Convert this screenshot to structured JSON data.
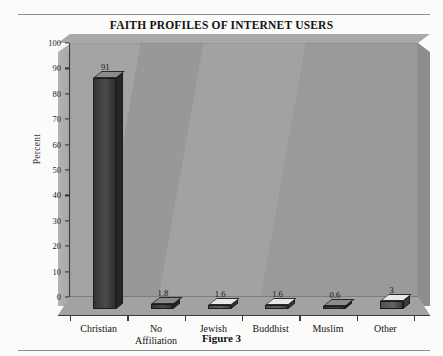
{
  "figure": {
    "caption": "Figure 3"
  },
  "chart_data": {
    "type": "bar",
    "title": "FAITH PROFILES OF INTERNET USERS",
    "xlabel": "",
    "ylabel": "Percent",
    "ylim": [
      0,
      100
    ],
    "ytick_step": 10,
    "grid": false,
    "legend": "none",
    "categories": [
      "Christian",
      "No\nAffiliation",
      "Jewish",
      "Buddhist",
      "Muslim",
      "Other"
    ],
    "values": [
      91,
      1.8,
      1.6,
      1.6,
      0.6,
      3
    ],
    "value_labels": [
      "91",
      "1.8",
      "1.6",
      "1.6",
      "0.6",
      "3"
    ],
    "ytick_labels": [
      "0",
      "10",
      "20",
      "30",
      "40",
      "50",
      "60",
      "70",
      "80",
      "90",
      "100"
    ],
    "bar_styles": [
      "dark",
      "dark",
      "light",
      "light",
      "dark",
      "light"
    ],
    "colors": {
      "wall": "#9d9d9d",
      "floor": "#a2a2a2",
      "bar_dark": "#343434",
      "bar_light": "#5a5a5a",
      "bar_top_light": "#e8e8e6",
      "axis": "#3c3c3c",
      "text": "#131313"
    }
  }
}
